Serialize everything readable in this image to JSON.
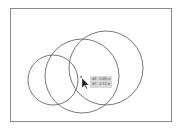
{
  "canvas": {
    "artboard": {
      "x": 10,
      "y": 8,
      "width": 162,
      "height": 114,
      "border_color": "#8a8a8a"
    },
    "shapes": [
      {
        "type": "circle",
        "name": "left-circle",
        "cx": 53,
        "cy": 80,
        "r": 25,
        "stroke": "#555555"
      },
      {
        "type": "circle",
        "name": "middle-circle",
        "cx": 82,
        "cy": 76,
        "r": 37,
        "stroke": "#555555"
      },
      {
        "type": "circle",
        "name": "right-circle",
        "cx": 106,
        "cy": 68,
        "r": 37,
        "stroke": "#555555"
      }
    ]
  },
  "cursor": {
    "icon": "arrow-pointer-icon",
    "x": 82,
    "y": 78
  },
  "tooltip": {
    "dx": "dX: -0.68 in",
    "dy": "dY: -0.12 in"
  }
}
